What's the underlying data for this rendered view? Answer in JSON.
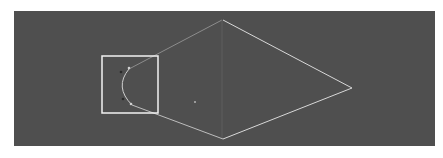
{
  "viewport": {
    "background": "#4f4f4f",
    "label": ""
  },
  "shape": {
    "type": "kite-curve",
    "vertices": {
      "top": [
        208,
        9
      ],
      "right": [
        338,
        77
      ],
      "bottom": [
        209,
        128
      ],
      "left_curve_top": [
        115,
        58
      ],
      "left_curve_bottom": [
        118,
        94
      ]
    },
    "bright_edge_color": "#d8d8d8",
    "faint_edge_color": "#8c8c8c"
  },
  "selection_box": {
    "x": 88,
    "y": 45,
    "width": 56,
    "height": 57,
    "color": "#f2f2f2"
  },
  "control_points": [
    {
      "name": "handle-top-dark",
      "x": 107,
      "y": 61
    },
    {
      "name": "handle-top-light",
      "x": 115,
      "y": 57
    },
    {
      "name": "handle-bottom-dark",
      "x": 109,
      "y": 88
    },
    {
      "name": "handle-bottom-light",
      "x": 117,
      "y": 93
    }
  ],
  "pivot_point": {
    "x": 181,
    "y": 91
  }
}
